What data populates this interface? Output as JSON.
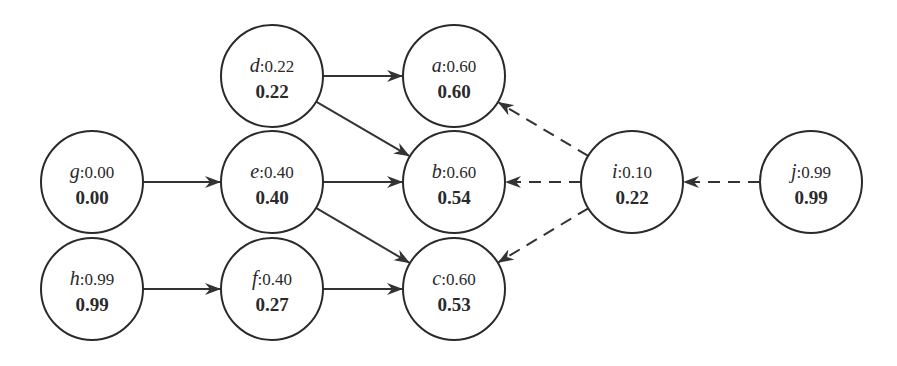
{
  "diagram": {
    "type": "directed-graph",
    "style": {
      "node_stroke": "#2a2a2a",
      "edge_color": "#333333",
      "background": "#ffffff"
    },
    "nodes": [
      {
        "id": "d",
        "name": "d",
        "prior": "0.22",
        "value": "0.22",
        "cx": 272,
        "cy": 76
      },
      {
        "id": "a",
        "name": "a",
        "prior": "0.60",
        "value": "0.60",
        "cx": 454,
        "cy": 76
      },
      {
        "id": "g",
        "name": "g",
        "prior": "0.00",
        "value": "0.00",
        "cx": 92,
        "cy": 182
      },
      {
        "id": "e",
        "name": "e",
        "prior": "0.40",
        "value": "0.40",
        "cx": 272,
        "cy": 182
      },
      {
        "id": "b",
        "name": "b",
        "prior": "0.60",
        "value": "0.54",
        "cx": 454,
        "cy": 182
      },
      {
        "id": "i",
        "name": "i",
        "prior": "0.10",
        "value": "0.22",
        "cx": 632,
        "cy": 182
      },
      {
        "id": "j",
        "name": "j",
        "prior": "0.99",
        "value": "0.99",
        "cx": 811,
        "cy": 182
      },
      {
        "id": "h",
        "name": "h",
        "prior": "0.99",
        "value": "0.99",
        "cx": 92,
        "cy": 289
      },
      {
        "id": "f",
        "name": "f",
        "prior": "0.40",
        "value": "0.27",
        "cx": 272,
        "cy": 289
      },
      {
        "id": "c",
        "name": "c",
        "prior": "0.60",
        "value": "0.53",
        "cx": 454,
        "cy": 289
      }
    ],
    "edges": [
      {
        "from": "d",
        "to": "a",
        "style": "solid"
      },
      {
        "from": "d",
        "to": "b",
        "style": "solid"
      },
      {
        "from": "g",
        "to": "e",
        "style": "solid"
      },
      {
        "from": "e",
        "to": "b",
        "style": "solid"
      },
      {
        "from": "e",
        "to": "c",
        "style": "solid"
      },
      {
        "from": "h",
        "to": "f",
        "style": "solid"
      },
      {
        "from": "f",
        "to": "c",
        "style": "solid"
      },
      {
        "from": "i",
        "to": "a",
        "style": "dashed"
      },
      {
        "from": "i",
        "to": "b",
        "style": "dashed"
      },
      {
        "from": "i",
        "to": "c",
        "style": "dashed"
      },
      {
        "from": "j",
        "to": "i",
        "style": "dashed"
      }
    ],
    "node_radius": 51
  }
}
